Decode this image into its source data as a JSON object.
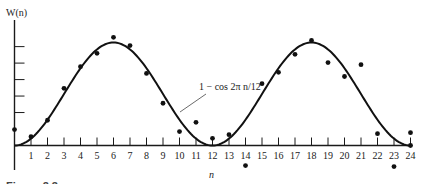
{
  "chart_data": {
    "type": "scatter",
    "title": "",
    "ylabel": "W(n)",
    "xlabel": "n",
    "xlim": [
      0,
      24
    ],
    "ylim": [
      -0.6,
      2.5
    ],
    "x_ticks": [
      1,
      2,
      3,
      4,
      5,
      6,
      7,
      8,
      9,
      10,
      11,
      12,
      13,
      14,
      15,
      16,
      17,
      18,
      19,
      20,
      21,
      22,
      23,
      24
    ],
    "x_tick_labels": [
      "1",
      "2",
      "3",
      "4",
      "5",
      "6",
      "7",
      "8",
      "9",
      "10",
      "11",
      "12",
      "13",
      "14",
      "15",
      "16",
      "17",
      "18",
      "19",
      "20",
      "21",
      "22",
      "23",
      "24"
    ],
    "y_ticks_unlabeled": [
      0.64,
      0.96,
      1.28,
      1.6,
      1.92
    ],
    "grid": false,
    "series": [
      {
        "name": "observed",
        "kind": "points",
        "x": [
          0,
          1,
          2,
          3,
          4,
          5,
          6,
          7,
          8,
          9,
          10,
          11,
          12,
          13,
          14,
          15,
          16,
          17,
          18,
          19,
          20,
          21,
          22,
          23,
          24,
          24
        ],
        "y": [
          0.31,
          0.17,
          0.49,
          1.11,
          1.53,
          1.79,
          2.1,
          1.94,
          1.4,
          0.82,
          0.27,
          0.45,
          0.14,
          0.21,
          -0.39,
          1.2,
          1.42,
          1.77,
          2.04,
          1.61,
          1.34,
          1.57,
          0.23,
          -0.41,
          0.25,
          0.0
        ]
      },
      {
        "name": "1 − cos 2π n/12",
        "kind": "curve",
        "formula": "1 - cos(2*pi*n/12)"
      }
    ],
    "annotations": [
      {
        "text": "1 − cos 2π n/12",
        "points_to_x": 9.6
      }
    ]
  },
  "caption": "Figure 2.3"
}
